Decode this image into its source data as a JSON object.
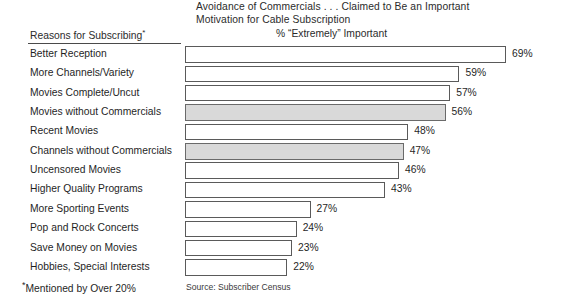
{
  "title": {
    "line1": "Avoidance of Commercials . . . Claimed to Be an Important",
    "line2": "Motivation for Cable Subscription"
  },
  "headers": {
    "left": "Reasons for Subscribing",
    "left_marker": "*",
    "right": "% “Extremely” Important"
  },
  "footnote": {
    "marker": "*",
    "text": "Mentioned by Over 20%"
  },
  "source": "Source: Subscriber Census",
  "colors": {
    "bar_fill": "#ffffff",
    "bar_highlight_fill": "#d9d9d9",
    "bar_stroke": "#5a5a5a",
    "text": "#1f1f1f",
    "background": "#ffffff"
  },
  "chart_data": {
    "type": "bar",
    "orientation": "horizontal",
    "title": "Avoidance of Commercials . . . Claimed to Be an Important Motivation for Cable Subscription",
    "xlabel": "% “Extremely” Important",
    "ylabel": "Reasons for Subscribing*",
    "xlim": [
      0,
      69
    ],
    "grid": false,
    "legend": null,
    "categories": [
      "Better Reception",
      "More Channels/Variety",
      "Movies Complete/Uncut",
      "Movies without Commercials",
      "Recent Movies",
      "Channels without Commercials",
      "Uncensored Movies",
      "Higher Quality Programs",
      "More Sporting Events",
      "Pop and Rock Concerts",
      "Save Money on Movies",
      "Hobbies, Special Interests"
    ],
    "values": [
      69,
      59,
      57,
      56,
      48,
      47,
      46,
      43,
      27,
      24,
      23,
      22
    ],
    "value_labels": [
      "69%",
      "59%",
      "57%",
      "56%",
      "48%",
      "47%",
      "46%",
      "43%",
      "27%",
      "24%",
      "23%",
      "22%"
    ],
    "highlighted": [
      false,
      false,
      false,
      true,
      false,
      true,
      false,
      false,
      false,
      false,
      false,
      false
    ],
    "note": "Shaded bars indicate commercial-avoidance reasons"
  },
  "rows": [
    {
      "label": "Better Reception",
      "value": 69,
      "value_label": "69%",
      "highlighted": false
    },
    {
      "label": "More Channels/Variety",
      "value": 59,
      "value_label": "59%",
      "highlighted": false
    },
    {
      "label": "Movies Complete/Uncut",
      "value": 57,
      "value_label": "57%",
      "highlighted": false
    },
    {
      "label": "Movies without Commercials",
      "value": 56,
      "value_label": "56%",
      "highlighted": true
    },
    {
      "label": "Recent Movies",
      "value": 48,
      "value_label": "48%",
      "highlighted": false
    },
    {
      "label": "Channels without Commercials",
      "value": 47,
      "value_label": "47%",
      "highlighted": true
    },
    {
      "label": "Uncensored Movies",
      "value": 46,
      "value_label": "46%",
      "highlighted": false
    },
    {
      "label": "Higher Quality Programs",
      "value": 43,
      "value_label": "43%",
      "highlighted": false
    },
    {
      "label": "More Sporting Events",
      "value": 27,
      "value_label": "27%",
      "highlighted": false
    },
    {
      "label": "Pop and Rock Concerts",
      "value": 24,
      "value_label": "24%",
      "highlighted": false
    },
    {
      "label": "Save Money on Movies",
      "value": 23,
      "value_label": "23%",
      "highlighted": false
    },
    {
      "label": "Hobbies, Special Interests",
      "value": 22,
      "value_label": "22%",
      "highlighted": false
    }
  ]
}
